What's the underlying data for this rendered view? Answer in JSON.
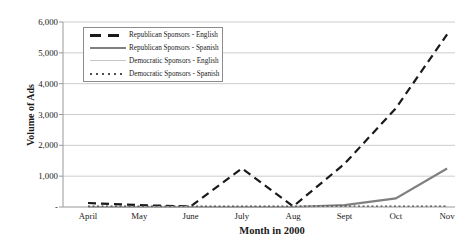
{
  "chart_data": {
    "type": "line",
    "title": "",
    "xlabel": "Month in 2000",
    "ylabel": "Volume of Ads",
    "categories": [
      "April",
      "May",
      "June",
      "July",
      "Aug",
      "Sept",
      "Oct",
      "Nov"
    ],
    "ylim": [
      0,
      6000
    ],
    "y_ticks": [
      {
        "label": "6,000",
        "value": 6000
      },
      {
        "label": "5,000",
        "value": 5000
      },
      {
        "label": "4,000",
        "value": 4000
      },
      {
        "label": "3,000",
        "value": 3000
      },
      {
        "label": "2,000",
        "value": 2000
      },
      {
        "label": "1,000",
        "value": 1000
      },
      {
        "label": "-",
        "value": 0
      }
    ],
    "grid": "horizontal-gridlines",
    "legend_position": "top-left-inside",
    "series": [
      {
        "name": "Republican Sponsors - English",
        "style": "dashed",
        "color": "#1a1a1a",
        "width": 2.2,
        "values": [
          130,
          60,
          20,
          1250,
          20,
          1400,
          3200,
          5600
        ]
      },
      {
        "name": "Republican Sponsors - Spanish",
        "style": "solid",
        "color": "#808080",
        "width": 2.2,
        "values": [
          0,
          0,
          0,
          0,
          0,
          60,
          280,
          1250
        ]
      },
      {
        "name": "Democratic Sponsors - English",
        "style": "solid",
        "color": "#c6c6c6",
        "width": 1,
        "values": [
          0,
          0,
          0,
          0,
          0,
          0,
          10,
          20
        ]
      },
      {
        "name": "Democratic Sponsors - Spanish",
        "style": "dotted",
        "color": "#4d4d4d",
        "width": 1.2,
        "values": [
          30,
          30,
          30,
          30,
          30,
          30,
          30,
          30
        ]
      }
    ]
  },
  "colors": {
    "background": "#ffffff",
    "gridline": "#cccccc",
    "axis": "#999999",
    "text": "#1a1a1a",
    "legend_border": "#8c8c8c"
  }
}
